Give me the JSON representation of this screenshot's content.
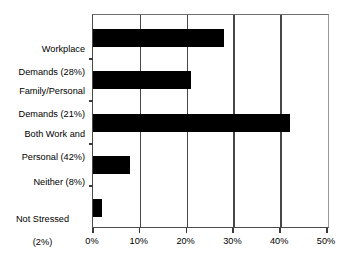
{
  "chart_data": {
    "type": "bar",
    "orientation": "horizontal",
    "title": "",
    "subtitle": "",
    "xlabel": "",
    "ylabel": "",
    "categories": [
      "Workplace Demands (28%)",
      "Family/Personal Demands (21%)",
      "Both Work and Personal (42%)",
      "Neither (8%)",
      "Not Stressed (2%)"
    ],
    "category_lines": [
      [
        "Workplace",
        "Demands (28%)"
      ],
      [
        "Family/Personal",
        "Demands (21%)"
      ],
      [
        "Both Work and",
        "Personal (42%)"
      ],
      [
        "Neither (8%)"
      ],
      [
        "Not Stressed",
        "(2%)"
      ]
    ],
    "values": [
      28,
      21,
      42,
      8,
      2
    ],
    "xlim": [
      0,
      50
    ],
    "xticks": [
      0,
      10,
      20,
      30,
      40,
      50
    ],
    "xtick_labels": [
      "0%",
      "10%",
      "20%",
      "30%",
      "40%",
      "50%"
    ],
    "grid": "vertical",
    "legend": "none",
    "bar_color": "#000000",
    "gridline_color": "#474747",
    "background_color": "#ffffff"
  }
}
